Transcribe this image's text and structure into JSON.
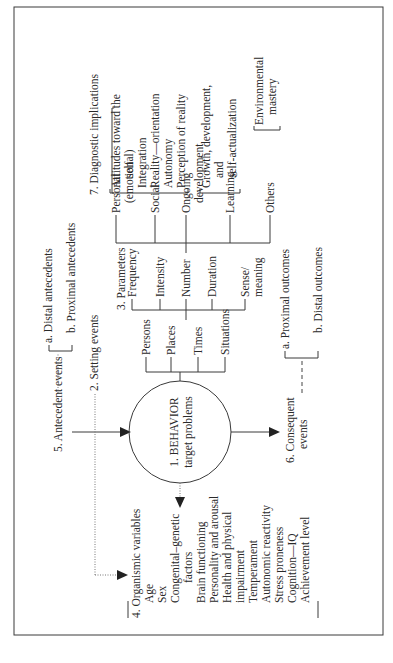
{
  "diagram": {
    "orientation": "rotated 90 degrees counter-clockwise",
    "behavior": {
      "number": "1. BEHAVIOR",
      "sub": "target problems"
    },
    "setting_events": {
      "label": "2. Setting events",
      "items": [
        "Persons",
        "Places",
        "Times",
        "Situations"
      ]
    },
    "parameters": {
      "label": "3. Parameters",
      "items": [
        "Frequency",
        "Intensity",
        "Number",
        "Duration",
        "Sense/",
        "meaning"
      ],
      "number_branch": [
        "Personal",
        "(emotional)",
        "Social",
        "Ongoing",
        "development",
        "Learning",
        "Others"
      ]
    },
    "organismic": {
      "label": "4. Organismic variables",
      "items": [
        "Age",
        "Sex",
        "Congenital–genetic",
        "factors",
        "Brain functioning",
        "Personality and arousal",
        "Health and physical",
        "impairment",
        "Temperament",
        "Autonomic reactivity",
        "Stress proneness",
        "Cognition—IQ",
        "Achievement level"
      ]
    },
    "antecedent": {
      "label": "5. Antecedent events",
      "a": "a. Distal antecedents",
      "b": "b. Proximal antecedents"
    },
    "consequent": {
      "label1": "6. Consequent",
      "label2": "events",
      "a": "a. Proximal outcomes",
      "b": "b. Distal outcomes"
    },
    "diagnostic": {
      "label": "7. Diagnostic implications",
      "group1": [
        "Attitudes toward the",
        "self",
        "Integration",
        "Reality—orientation",
        "Autonomy",
        "Perception of reality"
      ],
      "group2": [
        "Growth, development,",
        "and",
        "self-actualization"
      ],
      "group3": [
        "Environmental",
        "mastery"
      ]
    }
  }
}
